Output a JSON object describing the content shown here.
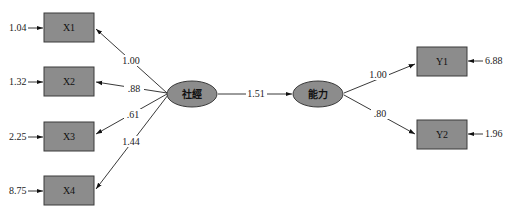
{
  "diagram": {
    "type": "structural-equation-model",
    "latent": [
      {
        "id": "ses",
        "label": "社經",
        "cx": 192,
        "cy": 94,
        "rx": 25,
        "ry": 13
      },
      {
        "id": "ability",
        "label": "能力",
        "cx": 318,
        "cy": 94,
        "rx": 25,
        "ry": 13
      }
    ],
    "observed": [
      {
        "id": "X1",
        "label": "X1",
        "x": 44,
        "y": 13,
        "w": 50,
        "h": 29,
        "error": "1.04",
        "error_side": "left"
      },
      {
        "id": "X2",
        "label": "X2",
        "x": 44,
        "y": 67,
        "w": 50,
        "h": 29,
        "error": "1.32",
        "error_side": "left"
      },
      {
        "id": "X3",
        "label": "X3",
        "x": 44,
        "y": 122,
        "w": 50,
        "h": 29,
        "error": "2.25",
        "error_side": "left"
      },
      {
        "id": "X4",
        "label": "X4",
        "x": 44,
        "y": 176,
        "w": 50,
        "h": 29,
        "error": "8.75",
        "error_side": "left"
      },
      {
        "id": "Y1",
        "label": "Y1",
        "x": 417,
        "y": 47,
        "w": 50,
        "h": 29,
        "error": "6.88",
        "error_side": "right"
      },
      {
        "id": "Y2",
        "label": "Y2",
        "x": 417,
        "y": 120,
        "w": 50,
        "h": 29,
        "error": "1.96",
        "error_side": "right"
      }
    ],
    "paths": [
      {
        "from": "ses",
        "to": "X1",
        "coef": "1.00"
      },
      {
        "from": "ses",
        "to": "X2",
        "coef": ".88"
      },
      {
        "from": "ses",
        "to": "X3",
        "coef": ".61"
      },
      {
        "from": "ses",
        "to": "X4",
        "coef": "1.44"
      },
      {
        "from": "ses",
        "to": "ability",
        "coef": "1.51"
      },
      {
        "from": "ability",
        "to": "Y1",
        "coef": "1.00"
      },
      {
        "from": "ability",
        "to": "Y2",
        "coef": ".80"
      }
    ]
  }
}
